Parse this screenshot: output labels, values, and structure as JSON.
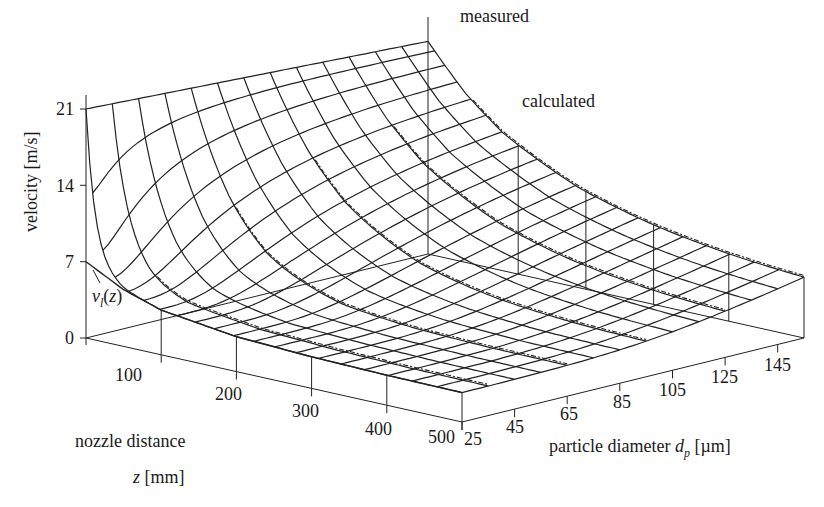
{
  "chart_data": {
    "type": "surface3d",
    "title": "",
    "zlabel": "velocity [m/s]",
    "xlabel": "nozzle distance",
    "xlabel_symbol": "z [mm]",
    "ylabel": "particle diameter",
    "ylabel_symbol": "d",
    "ylabel_subscript": "p",
    "ylabel_unit": "[µm]",
    "x_axis": {
      "name": "nozzle distance z",
      "unit": "mm",
      "range": [
        0,
        500
      ],
      "ticks": [
        100,
        200,
        300,
        400,
        500
      ]
    },
    "y_axis": {
      "name": "particle diameter d_p",
      "unit": "µm",
      "range": [
        25,
        155
      ],
      "ticks": [
        25,
        45,
        65,
        85,
        105,
        125,
        145
      ]
    },
    "z_axis": {
      "name": "velocity",
      "unit": "m/s",
      "range": [
        0,
        21
      ],
      "ticks": [
        0,
        7,
        14,
        21
      ]
    },
    "annotations": [
      {
        "text": "measured",
        "x": 460,
        "y": 8
      },
      {
        "text": "calculated",
        "x": 522,
        "y": 92
      },
      {
        "text": "v",
        "sub": "l",
        "suffix": "(z)",
        "x": 92,
        "y": 287
      }
    ],
    "series": [
      {
        "name": "calculated surface",
        "style": "solid wireframe"
      },
      {
        "name": "measured",
        "style": "dashed curves along z at several d_p"
      },
      {
        "name": "v_l(z)",
        "style": "liquid velocity curve at d_p→0"
      }
    ],
    "liquid_velocity_vl": {
      "z": [
        0,
        50,
        100,
        200,
        300,
        400,
        500
      ],
      "v": [
        7.0,
        5.2,
        4.1,
        3.2,
        2.9,
        2.75,
        2.7
      ]
    },
    "surface_corners": {
      "z0_dp25": 21.0,
      "z0_dp155": 19.5,
      "z500_dp25": 2.7,
      "z500_dp155": 4.0
    },
    "measured_dp_lines": [
      35,
      65,
      95,
      125,
      155
    ],
    "grid": {
      "nz": 20,
      "ndp": 13
    }
  }
}
